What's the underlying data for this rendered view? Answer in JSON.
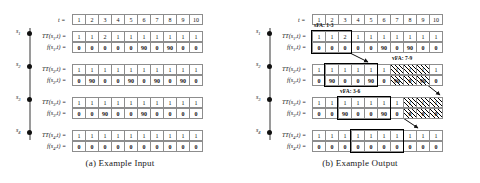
{
  "figure": {
    "time_header_label": "t =",
    "time_ticks": [
      "1",
      "2",
      "3",
      "4",
      "5",
      "6",
      "7",
      "8",
      "9",
      "10"
    ],
    "nodes": [
      "s1",
      "s2",
      "s3",
      "s4"
    ],
    "node_labels": [
      "s",
      "s",
      "s",
      "s"
    ],
    "node_subs": [
      "1",
      "2",
      "3",
      "4"
    ],
    "rows": [
      {
        "sensor": "s1",
        "tt_label": "TT(s1,t) =",
        "f_label": "f(s1,t) =",
        "tt_values": [
          "1",
          "1",
          "2",
          "1",
          "1",
          "1",
          "1",
          "1",
          "1",
          "1"
        ],
        "f_values": [
          "0",
          "0",
          "0",
          "0",
          "0",
          "90",
          "0",
          "90",
          "0",
          "0"
        ]
      },
      {
        "sensor": "s2",
        "tt_label": "TT(s2,t) =",
        "f_label": "f(s2,t) =",
        "tt_values": [
          "1",
          "1",
          "1",
          "1",
          "1",
          "1",
          "1",
          "1",
          "1",
          "1"
        ],
        "f_values": [
          "0",
          "90",
          "0",
          "0",
          "90",
          "0",
          "90",
          "0",
          "90",
          "0"
        ]
      },
      {
        "sensor": "s3",
        "tt_label": "TT(s3,t) =",
        "f_label": "f(s3,t) =",
        "tt_values": [
          "1",
          "1",
          "1",
          "1",
          "1",
          "1",
          "1",
          "1",
          "1",
          "1"
        ],
        "f_values": [
          "0",
          "0",
          "90",
          "0",
          "0",
          "90",
          "0",
          "0",
          "0",
          "0"
        ]
      },
      {
        "sensor": "s4",
        "tt_label": "TT(s4,t) =",
        "f_label": "f(s4,t) =",
        "tt_values": [
          "1",
          "1",
          "1",
          "1",
          "1",
          "1",
          "1",
          "1",
          "1",
          "1"
        ],
        "f_values": [
          "0",
          "0",
          "0",
          "0",
          "0",
          "0",
          "0",
          "0",
          "0",
          "0"
        ]
      }
    ],
    "panel_a": {
      "caption": "(a)  Example Input"
    },
    "panel_b": {
      "caption": "(b)  Example Output",
      "annotations": [
        {
          "name": "sfa-1-3",
          "text": "sFA: 1-3",
          "row": 0,
          "from": 1,
          "to": 3
        },
        {
          "name": "vfa-3-6",
          "text": "vFA: 3-6",
          "row": 2,
          "from": 3,
          "to": 6
        },
        {
          "name": "vfa-7-9",
          "text": "vFA: 7-9",
          "row": 1,
          "from": 7,
          "to": 9
        }
      ],
      "highlight_boxes": [
        {
          "name": "box-s1-1-3",
          "row": 0,
          "from": 1,
          "to": 3
        },
        {
          "name": "box-s2-2-5",
          "row": 1,
          "from": 2,
          "to": 5
        },
        {
          "name": "box-s3-3-6",
          "row": 2,
          "from": 3,
          "to": 6
        },
        {
          "name": "box-s4-4-7",
          "row": 3,
          "from": 4,
          "to": 7
        }
      ],
      "hatched_regions": [
        {
          "name": "hatch-s2-7-9",
          "row": 1,
          "from": 7,
          "to": 9
        },
        {
          "name": "hatch-s3-8-10",
          "row": 2,
          "from": 8,
          "to": 10
        }
      ]
    }
  },
  "colors": {
    "grid_line": "#8d8d8d",
    "text": "#111111",
    "spine": "#9a9a9a",
    "highlight": "#000000"
  }
}
